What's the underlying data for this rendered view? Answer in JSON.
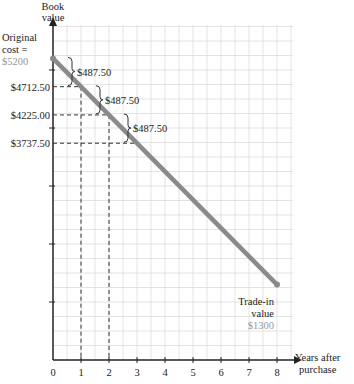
{
  "chart_data": {
    "type": "line",
    "title": "",
    "xlabel": "Years after purchase",
    "ylabel": "Book value",
    "x": [
      0,
      1,
      2,
      3,
      8
    ],
    "series": [
      {
        "name": "Book value",
        "values": [
          5200,
          4712.5,
          4225,
          3737.5,
          1300
        ]
      }
    ],
    "x_ticks": [
      "0",
      "1",
      "2",
      "3",
      "4",
      "5",
      "6",
      "7",
      "8"
    ],
    "y_labels": [
      "$4712.50",
      "$4225.00",
      "$3737.50"
    ],
    "annotations": {
      "original_cost": [
        "Original",
        "cost =",
        "$5200"
      ],
      "decrements": [
        "$487.50",
        "$487.50",
        "$487.50"
      ],
      "trade_in": [
        "Trade-in",
        "value",
        "$1300"
      ]
    },
    "grid": true,
    "line_color": "#8a8a8a"
  },
  "axis": {
    "y_title": [
      "Book",
      "value"
    ],
    "x_title": [
      "Years after",
      "purchase"
    ]
  }
}
